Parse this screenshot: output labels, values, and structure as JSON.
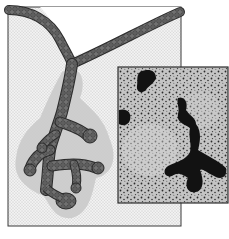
{
  "figure": {
    "colors": {
      "background": "#ffffff",
      "panel_fill": "#ededed",
      "panel_border": "#3a3a3a",
      "mesenchyme": "#c9c9c9",
      "duct_fill": "#6f6f6f",
      "duct_outline": "#2a2a2a",
      "inset_bg": "#bdbdbd",
      "inset_dark": "#111111",
      "inset_border": "#2e2e2e"
    },
    "main_panel": {
      "x": 8,
      "y": 7,
      "width": 173,
      "height": 219
    },
    "inset_panel": {
      "x": 118,
      "y": 67,
      "width": 110,
      "height": 136
    }
  }
}
